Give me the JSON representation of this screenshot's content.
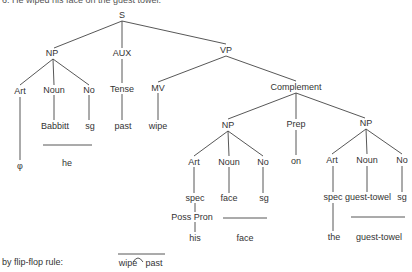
{
  "caption": "6. He wiped his face on the guest towel.",
  "nodes": {
    "s": "S",
    "np_subj": "NP",
    "aux": "AUX",
    "vp": "VP",
    "art1": "Art",
    "noun1": "Noun",
    "no1": "No",
    "tense": "Tense",
    "mv": "MV",
    "complement": "Complement",
    "babbitt": "Babbitt",
    "sg1": "sg",
    "past": "past",
    "wipe": "wipe",
    "phi": "φ",
    "he": "he",
    "np_obj": "NP",
    "prep": "Prep",
    "np_pobj": "NP",
    "art2": "Art",
    "noun2": "Noun",
    "no2": "No",
    "on": "on",
    "art3": "Art",
    "noun3": "Noun",
    "no3": "No",
    "spec1": "spec",
    "face": "face",
    "sg2": "sg",
    "posspron": "Poss Pron",
    "his": "his",
    "face_surface": "face",
    "spec2": "spec",
    "guesttowel": "guest-towel",
    "sg3": "sg",
    "the": "the",
    "guesttowel_surface": "guest-towel"
  },
  "flipflop": {
    "label": "by flip-flop rule:",
    "left": "wipe",
    "right": "past"
  }
}
